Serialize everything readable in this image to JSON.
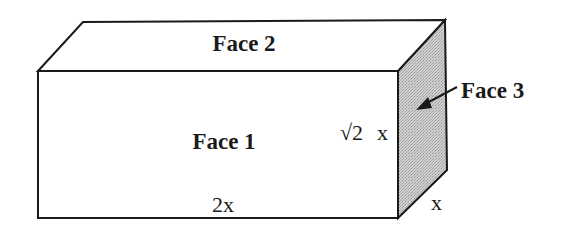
{
  "diagram": {
    "type": "rectangular-prism",
    "faces": [
      {
        "id": "face1",
        "label": "Face 1",
        "position": "front"
      },
      {
        "id": "face2",
        "label": "Face 2",
        "position": "top"
      },
      {
        "id": "face3",
        "label": "Face 3",
        "position": "right-side",
        "shaded": true
      }
    ],
    "dimensions": {
      "length": {
        "label": "2x"
      },
      "height": {
        "label_radical": "√2",
        "label_var": "x"
      },
      "depth": {
        "label": "x"
      }
    },
    "colors": {
      "stroke": "#1a1a1a",
      "face3_fill": "#c8c8c8",
      "background": "#ffffff"
    }
  }
}
